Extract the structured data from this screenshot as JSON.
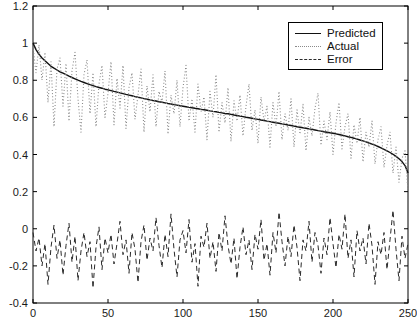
{
  "window": {
    "title": "Prediction plot"
  },
  "colors": {
    "background": "#ffffff",
    "axis": "#000000",
    "predicted_line": "#111111",
    "actual_line": "#8a8a8a",
    "error_line": "#2a2a2a"
  },
  "chart_data": {
    "type": "line",
    "title": "",
    "xlabel": "",
    "ylabel": "",
    "xlim": [
      0,
      250
    ],
    "ylim": [
      -0.4,
      1.2
    ],
    "grid": false,
    "legend_position": "top-right",
    "x_ticks": [
      0,
      50,
      100,
      150,
      200,
      250
    ],
    "x_tick_labels": [
      "0",
      "50",
      "100",
      "150",
      "200",
      "250"
    ],
    "y_ticks": [
      -0.4,
      -0.2,
      0,
      0.2,
      0.4,
      0.6,
      0.8,
      1,
      1.2
    ],
    "y_tick_labels": [
      "-0.4",
      "-0.2",
      "0",
      "0.2",
      "0.4",
      "0.6",
      "0.8",
      "1",
      "1.2"
    ],
    "x_start": 0,
    "x_step": 2,
    "series": [
      {
        "name": "Predicted",
        "style": "solid",
        "color": "#111111",
        "values": [
          1.0,
          0.965,
          0.94,
          0.92,
          0.905,
          0.89,
          0.875,
          0.865,
          0.855,
          0.845,
          0.838,
          0.83,
          0.822,
          0.815,
          0.808,
          0.8,
          0.794,
          0.788,
          0.782,
          0.776,
          0.771,
          0.766,
          0.761,
          0.757,
          0.752,
          0.748,
          0.744,
          0.74,
          0.736,
          0.732,
          0.728,
          0.724,
          0.72,
          0.716,
          0.712,
          0.708,
          0.705,
          0.701,
          0.698,
          0.694,
          0.691,
          0.688,
          0.684,
          0.681,
          0.678,
          0.675,
          0.672,
          0.669,
          0.666,
          0.663,
          0.66,
          0.657,
          0.654,
          0.652,
          0.649,
          0.646,
          0.643,
          0.641,
          0.638,
          0.635,
          0.632,
          0.63,
          0.627,
          0.624,
          0.621,
          0.619,
          0.616,
          0.613,
          0.61,
          0.607,
          0.604,
          0.601,
          0.598,
          0.595,
          0.592,
          0.589,
          0.586,
          0.583,
          0.58,
          0.577,
          0.574,
          0.571,
          0.568,
          0.565,
          0.562,
          0.559,
          0.556,
          0.553,
          0.55,
          0.547,
          0.544,
          0.541,
          0.538,
          0.535,
          0.532,
          0.529,
          0.526,
          0.523,
          0.52,
          0.517,
          0.514,
          0.511,
          0.508,
          0.504,
          0.5,
          0.496,
          0.492,
          0.488,
          0.483,
          0.478,
          0.473,
          0.468,
          0.462,
          0.456,
          0.45,
          0.443,
          0.436,
          0.428,
          0.42,
          0.411,
          0.401,
          0.39,
          0.377,
          0.362,
          0.34,
          0.3
        ]
      },
      {
        "name": "Actual",
        "style": "dotted",
        "color": "#8a8a8a",
        "values": [
          0.98,
          0.84,
          0.99,
          0.8,
          0.95,
          0.68,
          0.9,
          0.55,
          0.86,
          0.92,
          0.66,
          0.89,
          0.58,
          0.85,
          0.95,
          0.7,
          0.52,
          0.83,
          0.91,
          0.62,
          0.84,
          0.55,
          0.78,
          0.88,
          0.6,
          0.73,
          0.9,
          0.56,
          0.81,
          0.65,
          0.88,
          0.54,
          0.76,
          0.84,
          0.59,
          0.72,
          0.86,
          0.52,
          0.77,
          0.63,
          0.83,
          0.55,
          0.74,
          0.68,
          0.85,
          0.51,
          0.72,
          0.62,
          0.8,
          0.55,
          0.76,
          0.88,
          0.58,
          0.7,
          0.52,
          0.78,
          0.63,
          0.71,
          0.48,
          0.74,
          0.6,
          0.83,
          0.52,
          0.68,
          0.57,
          0.76,
          0.47,
          0.69,
          0.58,
          0.72,
          0.5,
          0.66,
          0.78,
          0.53,
          0.64,
          0.46,
          0.71,
          0.58,
          0.66,
          0.44,
          0.68,
          0.55,
          0.74,
          0.48,
          0.62,
          0.53,
          0.7,
          0.44,
          0.64,
          0.51,
          0.67,
          0.42,
          0.6,
          0.5,
          0.65,
          0.73,
          0.45,
          0.58,
          0.48,
          0.63,
          0.4,
          0.57,
          0.68,
          0.43,
          0.55,
          0.62,
          0.38,
          0.56,
          0.46,
          0.6,
          0.36,
          0.52,
          0.44,
          0.58,
          0.35,
          0.48,
          0.55,
          0.33,
          0.45,
          0.52,
          0.3,
          0.44,
          0.25,
          0.38,
          0.42,
          0.2
        ]
      },
      {
        "name": "Error",
        "style": "dashed",
        "color": "#2a2a2a",
        "values": [
          -0.02,
          -0.12,
          -0.05,
          -0.2,
          -0.08,
          -0.3,
          -0.1,
          0.02,
          -0.16,
          -0.06,
          -0.25,
          -0.09,
          0.03,
          -0.18,
          -0.04,
          -0.28,
          -0.12,
          -0.02,
          -0.15,
          -0.07,
          -0.32,
          -0.1,
          0.01,
          -0.22,
          -0.05,
          -0.13,
          -0.03,
          -0.19,
          -0.08,
          0.04,
          -0.14,
          -0.06,
          -0.24,
          -0.02,
          -0.11,
          -0.29,
          -0.07,
          0.02,
          -0.17,
          -0.05,
          -0.12,
          0.06,
          -0.09,
          -0.21,
          -0.03,
          -0.15,
          0.08,
          -0.11,
          -0.26,
          -0.06,
          -0.01,
          -0.13,
          0.05,
          -0.18,
          -0.08,
          -0.31,
          -0.04,
          -0.1,
          0.03,
          -0.16,
          -0.07,
          -0.23,
          -0.02,
          -0.12,
          0.07,
          -0.09,
          -0.19,
          -0.05,
          -0.27,
          -0.1,
          0.01,
          -0.14,
          -0.06,
          -0.22,
          -0.03,
          -0.11,
          0.05,
          -0.17,
          -0.08,
          -0.25,
          -0.02,
          -0.13,
          0.09,
          -0.07,
          -0.2,
          -0.04,
          -0.15,
          0.02,
          -0.1,
          -0.28,
          -0.06,
          -0.12,
          0.04,
          -0.18,
          -0.02,
          -0.09,
          -0.24,
          -0.05,
          -0.14,
          0.06,
          -0.08,
          -0.21,
          -0.03,
          -0.11,
          0.08,
          -0.16,
          -0.06,
          -0.26,
          -0.01,
          -0.12,
          -0.05,
          -0.19,
          0.03,
          -0.09,
          -0.3,
          -0.07,
          -0.14,
          -0.02,
          -0.22,
          -0.06,
          0.1,
          -0.11,
          -0.28,
          -0.04,
          -0.16,
          -0.08
        ]
      }
    ]
  }
}
